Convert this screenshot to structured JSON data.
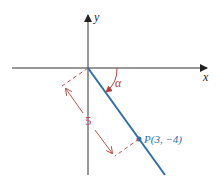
{
  "diagram": {
    "axes": {
      "x_label": "x",
      "y_label": "y"
    },
    "angle_label": "α",
    "length_label": "5",
    "point_label": "P(3, −4)",
    "colors": {
      "axis": "#333333",
      "ray": "#2f6fa6",
      "dim": "#c0504d",
      "angle": "#b5413c"
    }
  }
}
